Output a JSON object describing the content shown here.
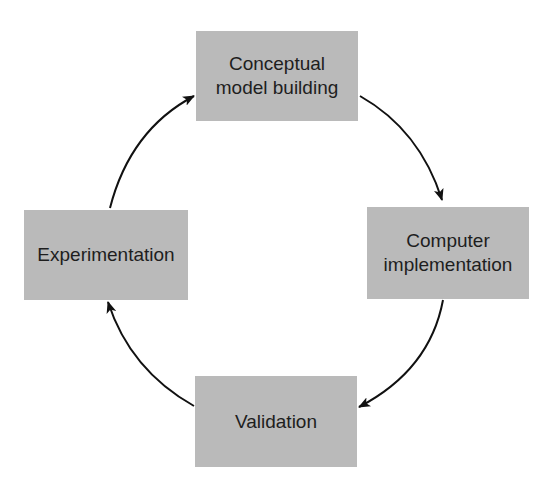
{
  "diagram": {
    "type": "cycle",
    "nodes": [
      {
        "id": "top",
        "label": "Conceptual\nmodel building"
      },
      {
        "id": "right",
        "label": "Computer\nimplementation"
      },
      {
        "id": "bottom",
        "label": "Validation"
      },
      {
        "id": "left",
        "label": "Experimentation"
      }
    ],
    "edges": [
      {
        "from": "top",
        "to": "right"
      },
      {
        "from": "right",
        "to": "bottom"
      },
      {
        "from": "bottom",
        "to": "left"
      },
      {
        "from": "left",
        "to": "top"
      }
    ],
    "colors": {
      "node_fill": "#bababa",
      "text": "#1e1e1e",
      "arrow": "#111111",
      "background": "#ffffff"
    }
  }
}
